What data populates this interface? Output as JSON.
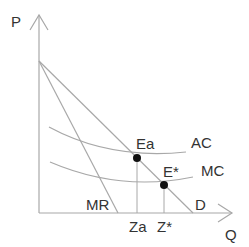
{
  "diagram": {
    "axes": {
      "y_label": "P",
      "x_label": "Q"
    },
    "curves": [
      {
        "id": "D",
        "label": "D",
        "description": "Demand curve"
      },
      {
        "id": "MR",
        "label": "MR",
        "description": "Marginal revenue curve"
      },
      {
        "id": "AC",
        "label": "AC",
        "description": "Average cost curve"
      },
      {
        "id": "MC",
        "label": "MC",
        "description": "Marginal cost curve"
      }
    ],
    "points": [
      {
        "id": "Ea",
        "label": "Ea",
        "description": "Intersection of demand and AC"
      },
      {
        "id": "Estar",
        "label": "E*",
        "description": "Intersection of demand and MC"
      }
    ],
    "x_ticks": [
      {
        "id": "Za",
        "label": "Za"
      },
      {
        "id": "Zstar",
        "label": "Z*"
      }
    ],
    "colors": {
      "line": "#a8a8a8",
      "text": "#333333",
      "point": "#111111"
    }
  }
}
